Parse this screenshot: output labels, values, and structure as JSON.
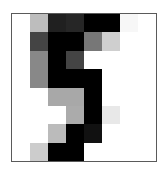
{
  "image": {
    "description": "8x8 grayscale pixel grid depicting a handwritten digit",
    "digit": "5",
    "rows": 8,
    "cols": 8,
    "border_color": "#5a5a5a",
    "pixels": [
      [
        "#ffffff",
        "#bdbdbd",
        "#202020",
        "#262626",
        "#000000",
        "#000000",
        "#f7f7f7",
        "#ffffff"
      ],
      [
        "#ffffff",
        "#444444",
        "#000000",
        "#000000",
        "#777777",
        "#cfcfcf",
        "#ffffff",
        "#ffffff"
      ],
      [
        "#ffffff",
        "#888888",
        "#000000",
        "#444444",
        "#ffffff",
        "#ffffff",
        "#ffffff",
        "#ffffff"
      ],
      [
        "#ffffff",
        "#888888",
        "#000000",
        "#000000",
        "#000000",
        "#ffffff",
        "#ffffff",
        "#ffffff"
      ],
      [
        "#ffffff",
        "#ffffff",
        "#a8a8a8",
        "#a8a8a8",
        "#000000",
        "#ffffff",
        "#ffffff",
        "#ffffff"
      ],
      [
        "#ffffff",
        "#ffffff",
        "#ffffff",
        "#ababab",
        "#000000",
        "#e8e8e8",
        "#ffffff",
        "#ffffff"
      ],
      [
        "#ffffff",
        "#ffffff",
        "#bbbbbb",
        "#000000",
        "#111111",
        "#ffffff",
        "#ffffff",
        "#ffffff"
      ],
      [
        "#ffffff",
        "#cccccc",
        "#000000",
        "#000000",
        "#ffffff",
        "#ffffff",
        "#ffffff",
        "#ffffff"
      ]
    ]
  }
}
